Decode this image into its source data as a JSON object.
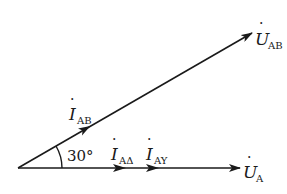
{
  "diagram": {
    "type": "phasor-diagram",
    "angle_label": "30°",
    "phasors": [
      {
        "id": "U_A",
        "symbol": "U",
        "dot": true,
        "subscript": "A",
        "label": "U̇_A",
        "direction": "horizontal"
      },
      {
        "id": "U_AB",
        "symbol": "U",
        "dot": true,
        "subscript": "AB",
        "label": "U̇_AB",
        "direction": "30° above horizontal"
      },
      {
        "id": "I_AB",
        "symbol": "I",
        "dot": true,
        "subscript": "AB",
        "label": "İ_AB",
        "direction": "along U_AB"
      },
      {
        "id": "I_Adelta",
        "symbol": "I",
        "dot": true,
        "subscript": "AΔ",
        "label": "İ_AΔ",
        "direction": "along U_A"
      },
      {
        "id": "I_AY",
        "symbol": "I",
        "dot": true,
        "subscript": "AY",
        "label": "İ_AY",
        "direction": "along U_A"
      }
    ]
  },
  "labels": {
    "u_a_main": "U",
    "u_a_sub": "A",
    "u_ab_main": "U",
    "u_ab_sub": "AB",
    "i_ab_main": "I",
    "i_ab_sub": "AB",
    "i_adelta_main": "I",
    "i_adelta_sub": "AΔ",
    "i_ay_main": "I",
    "i_ay_sub": "AY",
    "angle": "30°",
    "dot": "·"
  },
  "colors": {
    "stroke": "#1a1a1a",
    "background": "#ffffff"
  }
}
